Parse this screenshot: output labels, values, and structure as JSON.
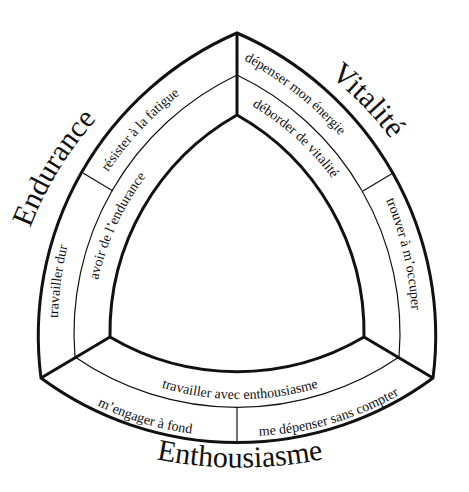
{
  "diagram": {
    "type": "curved-triangle-wheel",
    "colors": {
      "stroke": "#111111",
      "background": "#ffffff",
      "text": "#111111"
    },
    "sections": [
      {
        "title": "Endurance",
        "outer_items": [
          "résister à la fatigue",
          "travailler dur"
        ],
        "inner_item": "avoir de l’endurance"
      },
      {
        "title": "Vitalité",
        "outer_items": [
          "dépenser mon énergie",
          "trouver à m’occuper"
        ],
        "inner_item": "déborder de vitalité"
      },
      {
        "title": "Enthousiasme",
        "outer_items": [
          "m’engager à fond",
          "me dépenser sans compter"
        ],
        "inner_item": "travailler avec enthousiasme"
      }
    ]
  }
}
